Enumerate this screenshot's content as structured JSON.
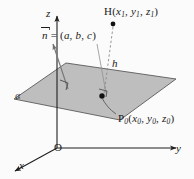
{
  "figure": {
    "title_text": "Distance from a point to a plane in 3D coordinates",
    "axes": {
      "x_label": "x",
      "y_label": "y",
      "z_label": "z",
      "origin_label": "O"
    },
    "plane": {
      "name_label": "α",
      "fill_color": "#b9b9b9",
      "edge_color": "#5a5a5a"
    },
    "points": {
      "h_point_label_prefix": "H(",
      "h_point_label": "H(x₁, y₁, z₁)",
      "h_name": "H",
      "h_x": "x",
      "h_x_sub": "1",
      "h_y": "y",
      "h_y_sub": "1",
      "h_z": "z",
      "h_z_sub": "1",
      "p0_point_label": "P₀(x₀, y₀, z₀)",
      "p0_name": "P",
      "p0_name_sub": "0",
      "p0_x": "x",
      "p0_x_sub": "0",
      "p0_y": "y",
      "p0_y_sub": "0",
      "p0_z": "z",
      "p0_z_sub": "0"
    },
    "vector": {
      "symbol": "n",
      "equals": " = (",
      "component_a": "a",
      "component_b": "b",
      "component_c": "c",
      "close": ")",
      "full_label": "n⃗ = (a, b, c)"
    },
    "distance": {
      "label": "h"
    },
    "colors": {
      "background": "#fbfbfb",
      "ink": "#1a1a1a",
      "plane_fill": "#b9b9b9",
      "plane_stroke": "#555555",
      "axis": "#2a2a2a",
      "dashed": "#8a8a8a"
    }
  }
}
